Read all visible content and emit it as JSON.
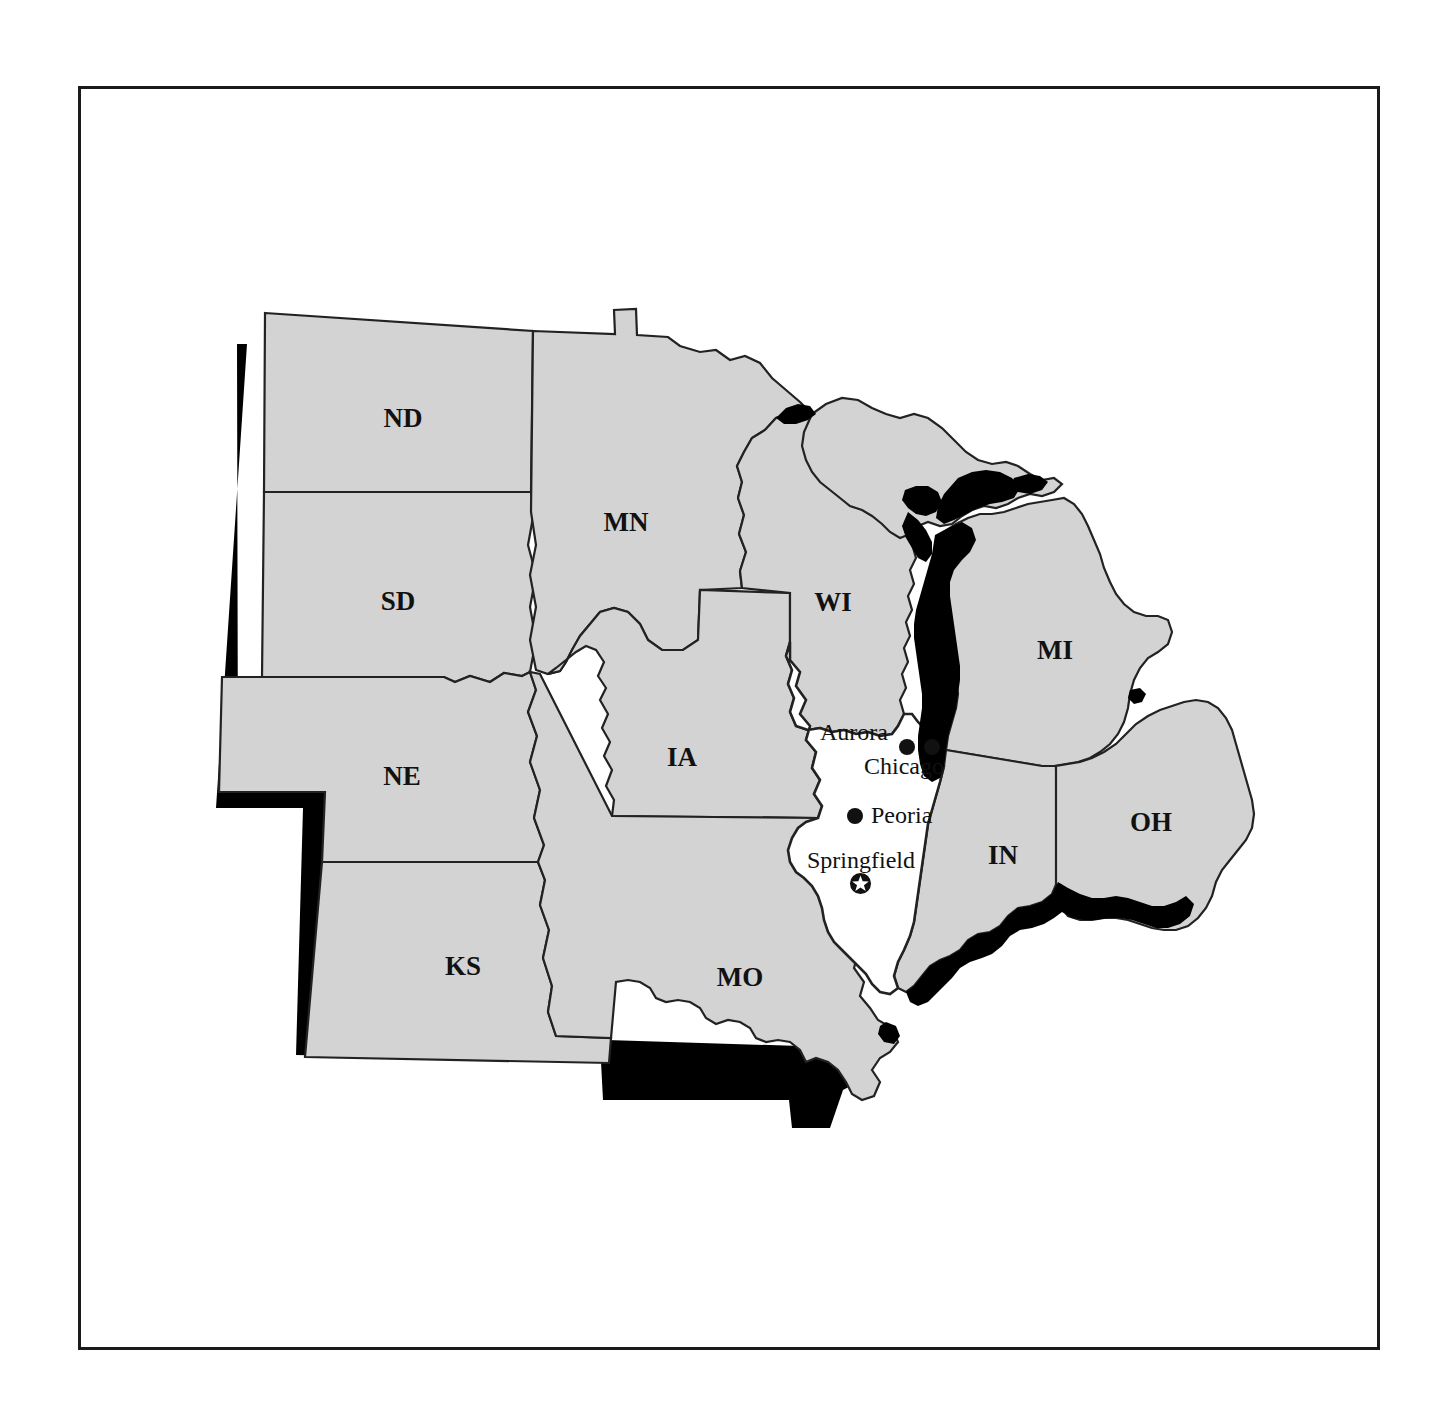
{
  "figure": {
    "frame_color": "#1a1a1a",
    "background_color": "#ffffff"
  },
  "map": {
    "land_fill": "#d3d3d3",
    "highlight_fill": "#ffffff",
    "water_fill": "#000000",
    "border_color": "#222222",
    "shadow_color": "#000000",
    "highlighted_state": "IL",
    "states": [
      {
        "code": "ND",
        "label": "ND",
        "label_x": 403,
        "label_y": 421
      },
      {
        "code": "SD",
        "label": "SD",
        "label_x": 398,
        "label_y": 604
      },
      {
        "code": "NE",
        "label": "NE",
        "label_x": 402,
        "label_y": 779
      },
      {
        "code": "KS",
        "label": "KS",
        "label_x": 463,
        "label_y": 969
      },
      {
        "code": "MN",
        "label": "MN",
        "label_x": 626,
        "label_y": 525
      },
      {
        "code": "IA",
        "label": "IA",
        "label_x": 682,
        "label_y": 760
      },
      {
        "code": "MO",
        "label": "MO",
        "label_x": 740,
        "label_y": 980
      },
      {
        "code": "WI",
        "label": "WI",
        "label_x": 833,
        "label_y": 605
      },
      {
        "code": "MI",
        "label": "MI",
        "label_x": 1055,
        "label_y": 653
      },
      {
        "code": "IN",
        "label": "IN",
        "label_x": 1003,
        "label_y": 858
      },
      {
        "code": "OH",
        "label": "OH",
        "label_x": 1151,
        "label_y": 825
      },
      {
        "code": "IL",
        "label": "",
        "label_x": 0,
        "label_y": 0
      }
    ],
    "cities": [
      {
        "name": "Aurora",
        "label": "Aurora",
        "dot_x": 907,
        "dot_y": 747,
        "dot_r": 8,
        "label_x": 888,
        "label_y": 734,
        "anchor": "end",
        "symbol": "dot"
      },
      {
        "name": "Chicago",
        "label": "Chicago",
        "dot_x": 932,
        "dot_y": 747,
        "dot_r": 8,
        "label_x": 944,
        "label_y": 768,
        "anchor": "end",
        "symbol": "dot"
      },
      {
        "name": "Peoria",
        "label": "Peoria",
        "dot_x": 855,
        "dot_y": 816,
        "dot_r": 8,
        "label_x": 871,
        "label_y": 817,
        "anchor": "start",
        "symbol": "dot"
      },
      {
        "name": "Springfield",
        "label": "Springfield",
        "dot_x": 861,
        "dot_y": 884,
        "dot_r": 11,
        "label_x": 861,
        "label_y": 862,
        "anchor": "middle",
        "symbol": "capital-star"
      }
    ],
    "lakes": [
      {
        "name": "Lake Michigan"
      },
      {
        "name": "Lake Superior"
      },
      {
        "name": "Lake Huron"
      },
      {
        "name": "Lake Erie"
      },
      {
        "name": "Green Bay"
      },
      {
        "name": "Ohio River"
      }
    ]
  }
}
